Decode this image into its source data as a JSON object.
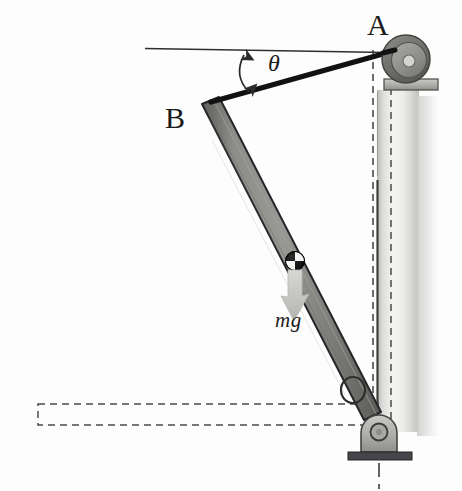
{
  "figure": {
    "background_color": "#fdfdfd"
  },
  "labels": {
    "point_a": "A",
    "point_b": "B",
    "angle": "θ",
    "weight": "mg"
  },
  "colors": {
    "rod_fill": "#7a7a78",
    "rod_fill_light": "#9a9a97",
    "rod_stroke": "#2b2b2b",
    "cable": "#121212",
    "wall_light": "#e9e9e7",
    "wall_mid": "#c9c9c6",
    "wall_shadow": "#d8d8d6",
    "pulley_outer": "#6e6e6c",
    "pulley_inner": "#8e8e8b",
    "pulley_hub": "#cfcfcc",
    "bracket_fill": "#b4b4b1",
    "base_plate": "#4a4a48",
    "dashed_line": "#4a4a48",
    "reference_line": "#2b2b2b",
    "mg_arrow": "#c4c4c1",
    "com_dark": "#131313",
    "com_light": "#f2f2f0",
    "text": "#1b1b1b"
  },
  "elements": {
    "reference_line": {
      "name": "horizontal-reference-line",
      "x1": 145,
      "y1": 48,
      "x2": 386,
      "y2": 52
    },
    "cable": {
      "name": "cable-rope",
      "from_point": "B",
      "to_point": "A",
      "x1": 212,
      "y1": 101,
      "x2": 388,
      "y2": 52,
      "width_px": 5
    },
    "rod": {
      "name": "rigid-rod",
      "top_x": 210,
      "top_y": 104,
      "bottom_x": 373,
      "bottom_y": 415,
      "width_px": 17
    },
    "angle_arc": {
      "name": "angle-arc-arrow",
      "vertex_x": 213,
      "vertex_y": 101,
      "double_headed": true
    },
    "center_of_mass": {
      "name": "center-of-mass-marker",
      "cx": 295,
      "cy": 261,
      "r": 9
    },
    "weight_arrow": {
      "name": "weight-force-arrow",
      "x": 295,
      "y_start": 268,
      "y_end": 320
    },
    "pulley": {
      "name": "pulley-wheel",
      "cx": 405,
      "cy": 60,
      "r_outer": 24,
      "r_inner": 17,
      "r_hub": 6
    },
    "pulley_bracket": {
      "name": "pulley-mount-bracket",
      "x": 385,
      "y": 80,
      "w": 52,
      "h": 12
    },
    "wall_post": {
      "name": "vertical-wall-post",
      "x": 377,
      "y": 90,
      "w": 40,
      "h": 340
    },
    "pin_support": {
      "name": "pin-support-bracket",
      "cx": 379,
      "cy": 430,
      "r": 8
    },
    "base_plate": {
      "name": "support-base-plate",
      "x": 350,
      "y": 452,
      "w": 62,
      "h": 8
    },
    "center_line": {
      "name": "vertical-center-line",
      "x": 379,
      "y1": 462,
      "y2": 488
    },
    "dashed_rect": {
      "name": "dashed-reference-rectangle",
      "x": 38,
      "y": 404,
      "w": 340,
      "h": 21
    },
    "dashed_vertical": {
      "name": "dashed-vertical-reference-line",
      "x": 373,
      "y1": 50,
      "y2": 412
    },
    "dashed_wall_line": {
      "name": "dashed-wall-edge-line",
      "x": 391,
      "y1": 88,
      "y2": 430
    },
    "collar": {
      "name": "rod-collar-ring",
      "cx": 353,
      "cy": 391,
      "r": 11
    }
  }
}
